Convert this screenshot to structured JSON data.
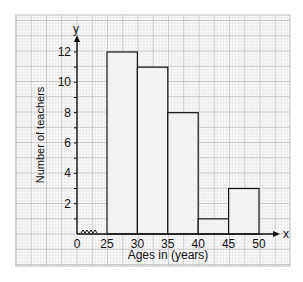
{
  "chart_data": {
    "type": "bar",
    "title": "",
    "xlabel": "Ages in (years)",
    "ylabel": "Number of teachers",
    "x_axis_letter": "x",
    "y_axis_letter": "y",
    "categories": [
      "25-30",
      "30-35",
      "35-40",
      "40-45",
      "45-50"
    ],
    "bin_edges": [
      25,
      30,
      35,
      40,
      45,
      50
    ],
    "values": [
      12,
      11,
      8,
      1,
      3
    ],
    "x_ticks": [
      "0",
      "25",
      "30",
      "35",
      "40",
      "45",
      "50"
    ],
    "y_ticks": [
      "2",
      "4",
      "6",
      "8",
      "10",
      "12"
    ],
    "ylim": [
      0,
      13
    ],
    "grid": true,
    "axis_break": true,
    "bar_fill": "#f2f2f2",
    "grid_color": "#cccccc"
  }
}
